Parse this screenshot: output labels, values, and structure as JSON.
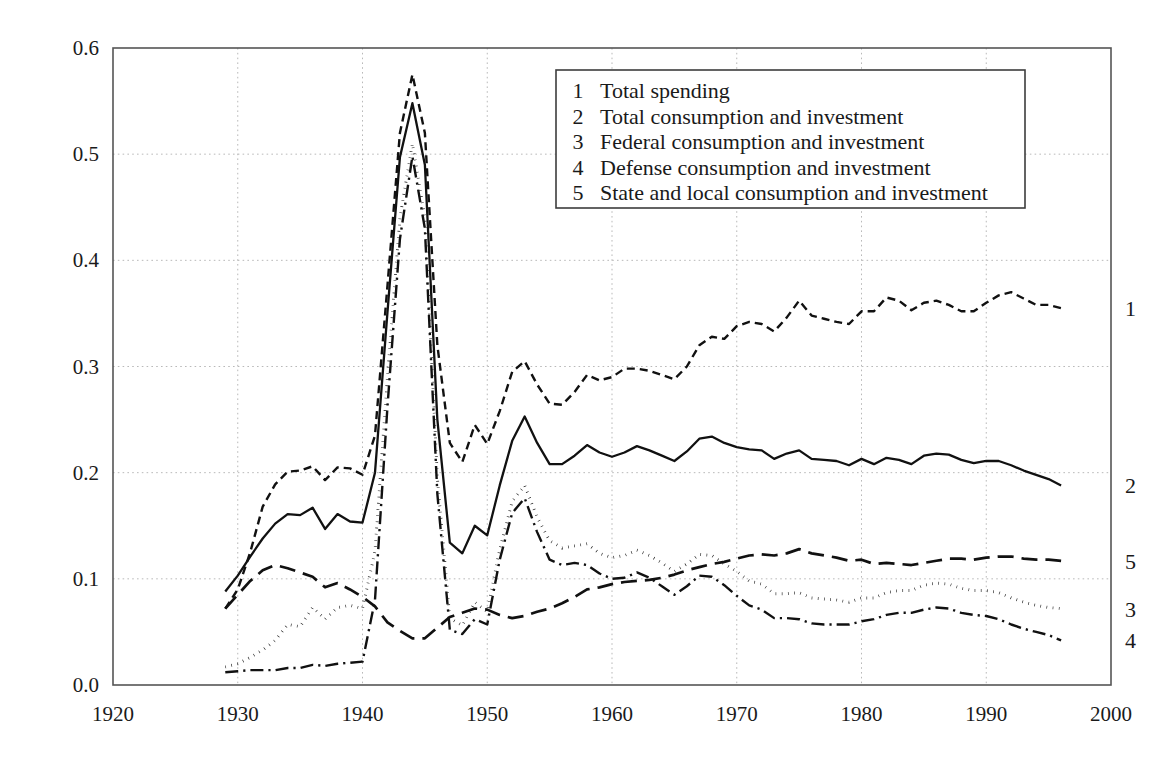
{
  "chart_data": {
    "type": "line",
    "title": "",
    "subtitle": "",
    "xlabel": "",
    "ylabel": "",
    "xlim": [
      1920,
      2000
    ],
    "ylim": [
      0.0,
      0.6
    ],
    "grid": true,
    "legend_position": "top-center-inside",
    "xticks": [
      "1920",
      "1930",
      "1940",
      "1950",
      "1960",
      "1970",
      "1980",
      "1990",
      "2000"
    ],
    "xtick_values": [
      1920,
      1930,
      1940,
      1950,
      1960,
      1970,
      1980,
      1990,
      2000
    ],
    "yticks": [
      "0.0",
      "0.1",
      "0.2",
      "0.3",
      "0.4",
      "0.5",
      "0.6"
    ],
    "ytick_values": [
      0.0,
      0.1,
      0.2,
      0.3,
      0.4,
      0.5,
      0.6
    ],
    "x": [
      1929,
      1930,
      1931,
      1932,
      1933,
      1934,
      1935,
      1936,
      1937,
      1938,
      1939,
      1940,
      1941,
      1942,
      1943,
      1944,
      1945,
      1946,
      1947,
      1948,
      1949,
      1950,
      1951,
      1952,
      1953,
      1954,
      1955,
      1956,
      1957,
      1958,
      1959,
      1960,
      1961,
      1962,
      1963,
      1964,
      1965,
      1966,
      1967,
      1968,
      1969,
      1970,
      1971,
      1972,
      1973,
      1974,
      1975,
      1976,
      1977,
      1978,
      1979,
      1980,
      1981,
      1982,
      1983,
      1984,
      1985,
      1986,
      1987,
      1988,
      1989,
      1990,
      1991,
      1992,
      1993,
      1994,
      1995,
      1996
    ],
    "series": [
      {
        "name": "Total spending",
        "key": "1",
        "linestyle": "short-dash",
        "end_label": "1",
        "values": [
          0.072,
          0.09,
          0.125,
          0.168,
          0.189,
          0.201,
          0.202,
          0.206,
          0.193,
          0.205,
          0.204,
          0.198,
          0.235,
          0.376,
          0.52,
          0.575,
          0.52,
          0.32,
          0.228,
          0.21,
          0.245,
          0.227,
          0.258,
          0.295,
          0.305,
          0.283,
          0.265,
          0.264,
          0.276,
          0.292,
          0.287,
          0.29,
          0.298,
          0.298,
          0.296,
          0.292,
          0.288,
          0.3,
          0.32,
          0.328,
          0.326,
          0.338,
          0.342,
          0.34,
          0.333,
          0.346,
          0.362,
          0.348,
          0.345,
          0.342,
          0.34,
          0.352,
          0.352,
          0.365,
          0.362,
          0.353,
          0.36,
          0.362,
          0.358,
          0.352,
          0.352,
          0.36,
          0.367,
          0.37,
          0.364,
          0.358,
          0.358,
          0.355
        ]
      },
      {
        "name": "Total consumption and investment",
        "key": "2",
        "linestyle": "solid",
        "end_label": "2",
        "values": [
          0.088,
          0.103,
          0.121,
          0.138,
          0.152,
          0.161,
          0.16,
          0.167,
          0.147,
          0.161,
          0.154,
          0.153,
          0.2,
          0.351,
          0.497,
          0.548,
          0.49,
          0.25,
          0.134,
          0.124,
          0.15,
          0.141,
          0.188,
          0.23,
          0.253,
          0.228,
          0.208,
          0.208,
          0.216,
          0.226,
          0.219,
          0.215,
          0.219,
          0.225,
          0.221,
          0.216,
          0.211,
          0.22,
          0.232,
          0.234,
          0.228,
          0.224,
          0.222,
          0.221,
          0.213,
          0.218,
          0.221,
          0.213,
          0.212,
          0.211,
          0.207,
          0.213,
          0.208,
          0.214,
          0.212,
          0.208,
          0.216,
          0.218,
          0.217,
          0.212,
          0.209,
          0.211,
          0.211,
          0.207,
          0.202,
          0.198,
          0.194,
          0.188
        ]
      },
      {
        "name": "Federal consumption and investment",
        "key": "3",
        "linestyle": "dotted",
        "end_label": "3",
        "values": [
          0.017,
          0.02,
          0.026,
          0.033,
          0.042,
          0.057,
          0.055,
          0.073,
          0.062,
          0.073,
          0.075,
          0.072,
          0.126,
          0.29,
          0.44,
          0.51,
          0.44,
          0.195,
          0.063,
          0.056,
          0.078,
          0.069,
          0.128,
          0.173,
          0.188,
          0.158,
          0.136,
          0.129,
          0.131,
          0.133,
          0.124,
          0.12,
          0.122,
          0.127,
          0.122,
          0.115,
          0.107,
          0.114,
          0.123,
          0.122,
          0.114,
          0.107,
          0.098,
          0.095,
          0.086,
          0.086,
          0.087,
          0.082,
          0.081,
          0.08,
          0.078,
          0.082,
          0.082,
          0.087,
          0.089,
          0.089,
          0.094,
          0.096,
          0.095,
          0.091,
          0.089,
          0.089,
          0.087,
          0.082,
          0.078,
          0.075,
          0.073,
          0.072
        ]
      },
      {
        "name": "Defense consumption and investment",
        "key": "4",
        "linestyle": "dash-dot",
        "end_label": "4",
        "values": [
          0.012,
          0.013,
          0.014,
          0.014,
          0.014,
          0.016,
          0.016,
          0.019,
          0.018,
          0.02,
          0.021,
          0.022,
          0.08,
          0.262,
          0.42,
          0.498,
          0.43,
          0.18,
          0.052,
          0.048,
          0.062,
          0.057,
          0.118,
          0.162,
          0.176,
          0.144,
          0.118,
          0.113,
          0.115,
          0.113,
          0.105,
          0.1,
          0.101,
          0.106,
          0.101,
          0.093,
          0.085,
          0.093,
          0.103,
          0.102,
          0.094,
          0.084,
          0.075,
          0.071,
          0.063,
          0.063,
          0.062,
          0.058,
          0.057,
          0.057,
          0.057,
          0.06,
          0.062,
          0.066,
          0.068,
          0.068,
          0.071,
          0.073,
          0.072,
          0.068,
          0.066,
          0.065,
          0.062,
          0.057,
          0.053,
          0.05,
          0.047,
          0.042
        ]
      },
      {
        "name": "State and local consumption and investment",
        "key": "5",
        "linestyle": "long-dash",
        "end_label": "5",
        "values": [
          0.072,
          0.085,
          0.098,
          0.108,
          0.113,
          0.11,
          0.106,
          0.102,
          0.092,
          0.096,
          0.09,
          0.083,
          0.074,
          0.059,
          0.051,
          0.044,
          0.044,
          0.054,
          0.064,
          0.068,
          0.072,
          0.071,
          0.066,
          0.063,
          0.065,
          0.069,
          0.072,
          0.077,
          0.083,
          0.09,
          0.092,
          0.095,
          0.097,
          0.098,
          0.099,
          0.101,
          0.104,
          0.108,
          0.111,
          0.114,
          0.116,
          0.119,
          0.122,
          0.123,
          0.122,
          0.124,
          0.128,
          0.124,
          0.122,
          0.12,
          0.117,
          0.118,
          0.114,
          0.115,
          0.114,
          0.113,
          0.115,
          0.117,
          0.119,
          0.119,
          0.118,
          0.12,
          0.121,
          0.121,
          0.119,
          0.118,
          0.118,
          0.117
        ]
      }
    ]
  },
  "legend": {
    "entries": [
      {
        "num": "1",
        "label": "Total spending"
      },
      {
        "num": "2",
        "label": "Total consumption and investment"
      },
      {
        "num": "3",
        "label": "Federal consumption and investment"
      },
      {
        "num": "4",
        "label": "Defense consumption and investment"
      },
      {
        "num": "5",
        "label": "State and local consumption and investment"
      }
    ]
  },
  "colors": {
    "line": "#111111",
    "frame": "#555555",
    "grid": "#b9b9b9",
    "text": "#1a1a1a",
    "background": "#ffffff"
  }
}
